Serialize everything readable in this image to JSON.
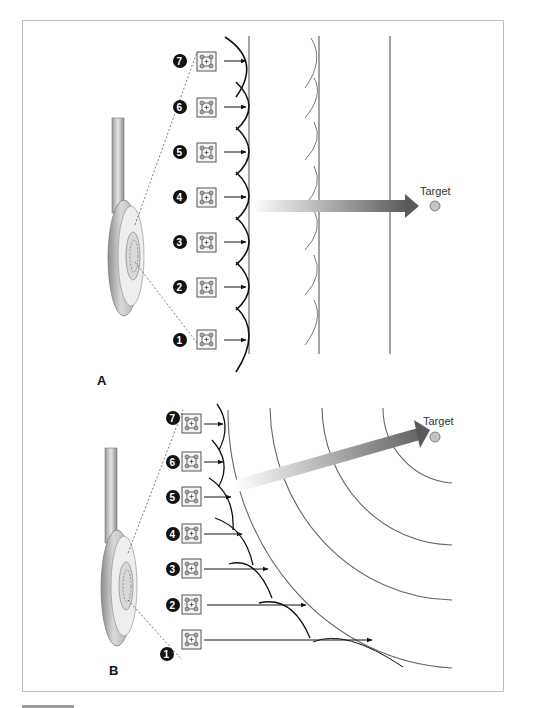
{
  "figure": {
    "panels": [
      {
        "id": "A",
        "label": "A",
        "description": "Linear phased array: all 7 elements fire simultaneously, producing a planar wavefront directed straight ahead",
        "elements": [
          {
            "number": "7"
          },
          {
            "number": "6"
          },
          {
            "number": "5"
          },
          {
            "number": "4"
          },
          {
            "number": "3"
          },
          {
            "number": "2"
          },
          {
            "number": "1"
          }
        ],
        "target_label": "Target"
      },
      {
        "id": "B",
        "label": "B",
        "description": "Phased array with time delays: element 1 fires first and element 7 last, producing a curved (steered) wavefront directed toward the target",
        "elements": [
          {
            "number": "7"
          },
          {
            "number": "6"
          },
          {
            "number": "5"
          },
          {
            "number": "4"
          },
          {
            "number": "3"
          },
          {
            "number": "2"
          },
          {
            "number": "1"
          }
        ],
        "target_label": "Target"
      }
    ],
    "colors": {
      "wavefront": "#111111",
      "wavefront_light": "#555555",
      "beam_start": "#ffffff",
      "beam_end": "#5a5a5a",
      "target_fill": "#c4c4c4",
      "number_badge": "#111111",
      "frame": "#bdbdbd"
    }
  }
}
